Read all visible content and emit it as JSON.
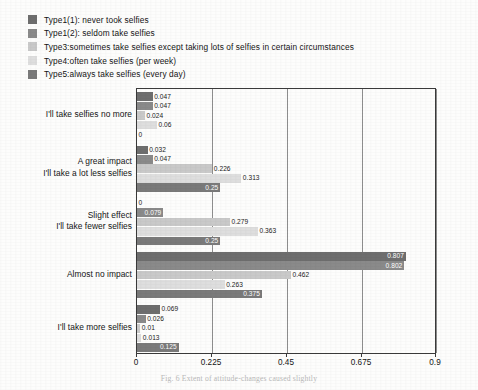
{
  "legend": {
    "items": [
      {
        "label": "Type1(1):  never took selfies",
        "color": "#6e6e6e",
        "name": "type1-1"
      },
      {
        "label": "Type1(2):  seldom take selfies",
        "color": "#8a8a8a",
        "name": "type1-2"
      },
      {
        "label": "Type3:sometimes take selfies except taking lots of selfies in certain circumstances",
        "color": "#c9c9c9",
        "name": "type3"
      },
      {
        "label": "Type4:often take selfies (per week)",
        "color": "#dedede",
        "name": "type4"
      },
      {
        "label": "Type5:always take selfies (every day)",
        "color": "#7a7a7a",
        "name": "type5"
      }
    ]
  },
  "caption": "Fig. 6   Extent of attitude-changes caused slightly",
  "chart_data": {
    "type": "bar",
    "orientation": "horizontal",
    "title": "",
    "xlabel": "",
    "ylabel": "",
    "xlim": [
      0,
      0.9
    ],
    "xticks": [
      "0",
      "0.225",
      "0.45",
      "0.675",
      "0.9"
    ],
    "xtick_values": [
      0,
      0.225,
      0.45,
      0.675,
      0.9
    ],
    "grid": true,
    "legend_position": "above-plot",
    "categories": [
      "I'll take selfies no more",
      "A great impact\nI'll take a lot less selfies",
      "Slight effect\nI'll take fewer selfies",
      "Almost no impact",
      "I'll take more selfies"
    ],
    "series": [
      {
        "name": "Type1(1):  never took selfies",
        "color": "#6e6e6e",
        "values": [
          0.047,
          0.032,
          0,
          0.807,
          0.069
        ]
      },
      {
        "name": "Type1(2):  seldom take selfies",
        "color": "#8a8a8a",
        "values": [
          0.047,
          0.047,
          0.079,
          0.802,
          0.026
        ]
      },
      {
        "name": "Type3:sometimes take selfies except taking lots of selfies in certain circumstances",
        "color": "#c9c9c9",
        "values": [
          0.024,
          0.226,
          0.279,
          0.462,
          0.01
        ]
      },
      {
        "name": "Type4:often take selfies (per week)",
        "color": "#dedede",
        "values": [
          0.06,
          0.313,
          0.363,
          0.263,
          0.013
        ]
      },
      {
        "name": "Type5:always take selfies (every day)",
        "color": "#7a7a7a",
        "values": [
          0,
          0.25,
          0.25,
          0.375,
          0.125
        ]
      }
    ],
    "value_labels": [
      [
        "0.047",
        "0.047",
        "0.024",
        "0.06",
        "0"
      ],
      [
        "0.032",
        "0.047",
        "0.226",
        "0.313",
        "0.25"
      ],
      [
        "0",
        "0.079",
        "0.279",
        "0.363",
        "0.25"
      ],
      [
        "0.807",
        "0.802",
        "0.462",
        "0.263",
        "0.375"
      ],
      [
        "0.069",
        "0.026",
        "0.01",
        "0.013",
        "0.125"
      ]
    ]
  }
}
